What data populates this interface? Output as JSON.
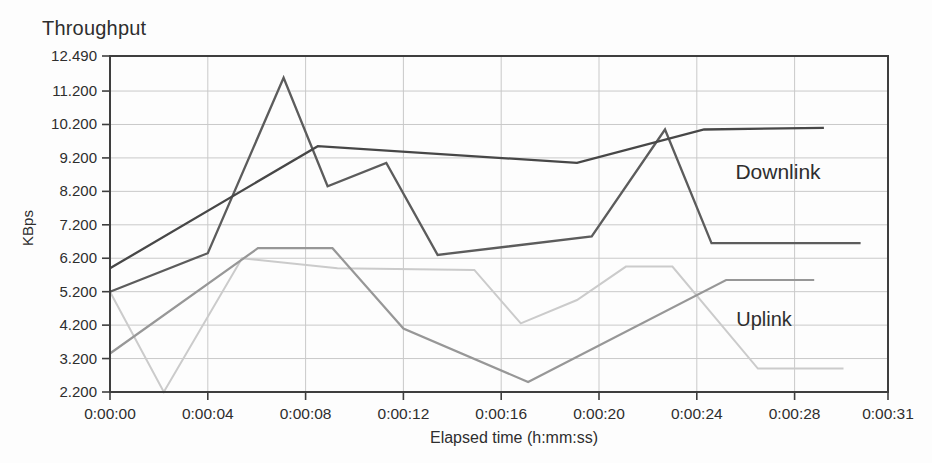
{
  "title": "Throughput",
  "colors": {
    "axis": "#3e3e3e",
    "grid": "#c9c9c9",
    "text": "#2e2e2e",
    "downlink_average": "#474747",
    "downlink_instant": "#5c5c5c",
    "uplink_average": "#979797",
    "uplink_instant": "#cbcbcb"
  },
  "chart_data": {
    "type": "line",
    "title": "Throughput",
    "xlabel": "Elapsed time (h:mm:ss)",
    "ylabel": "KBps",
    "ylim": [
      2.2,
      12.49
    ],
    "xlim_seconds": [
      0,
      31
    ],
    "grid": true,
    "legend_position": "in-plot text annotations",
    "y_ticks": [
      {
        "label": "12.490",
        "value": 12.49
      },
      {
        "label": "11.200",
        "value": 11.2
      },
      {
        "label": "10.200",
        "value": 10.2
      },
      {
        "label": "9.200",
        "value": 9.2
      },
      {
        "label": "8.200",
        "value": 8.2
      },
      {
        "label": "7.200",
        "value": 7.2
      },
      {
        "label": "6.200",
        "value": 6.2
      },
      {
        "label": "5.200",
        "value": 5.2
      },
      {
        "label": "4.200",
        "value": 4.2
      },
      {
        "label": "3.200",
        "value": 3.2
      },
      {
        "label": "2.200",
        "value": 2.2
      }
    ],
    "x_ticks": [
      {
        "label": "0:00:00",
        "t": 0
      },
      {
        "label": "0:00:04",
        "t": 4
      },
      {
        "label": "0:00:08",
        "t": 8
      },
      {
        "label": "0:00:12",
        "t": 12
      },
      {
        "label": "0:00:16",
        "t": 16
      },
      {
        "label": "0:00:20",
        "t": 20
      },
      {
        "label": "0:00:24",
        "t": 24
      },
      {
        "label": "0:00:28",
        "t": 28
      },
      {
        "label": "0:00:31",
        "t": 31
      }
    ],
    "series": [
      {
        "id": "uplink-instantaneous",
        "group": "Uplink",
        "color": "#cbcbcb",
        "width": 2,
        "points": [
          [
            0,
            5.2
          ],
          [
            2.2,
            2.2
          ],
          [
            5.4,
            6.2
          ],
          [
            9.3,
            5.9
          ],
          [
            14.9,
            5.85
          ],
          [
            16.8,
            4.25
          ],
          [
            19.1,
            4.95
          ],
          [
            21.1,
            5.95
          ],
          [
            23.0,
            5.95
          ],
          [
            26.5,
            2.9
          ],
          [
            30.0,
            2.9
          ]
        ]
      },
      {
        "id": "uplink-average",
        "group": "Uplink",
        "color": "#979797",
        "width": 2.2,
        "points": [
          [
            0,
            3.35
          ],
          [
            6.05,
            6.5
          ],
          [
            9.1,
            6.5
          ],
          [
            12.0,
            4.1
          ],
          [
            17.1,
            2.5
          ],
          [
            25.2,
            5.55
          ],
          [
            28.8,
            5.55
          ]
        ]
      },
      {
        "id": "downlink-instantaneous",
        "group": "Downlink",
        "color": "#5c5c5c",
        "width": 2.3,
        "points": [
          [
            0,
            5.2
          ],
          [
            4.0,
            6.35
          ],
          [
            7.1,
            11.6
          ],
          [
            8.9,
            8.35
          ],
          [
            11.3,
            9.05
          ],
          [
            13.4,
            6.3
          ],
          [
            19.7,
            6.85
          ],
          [
            22.7,
            10.05
          ],
          [
            24.6,
            6.65
          ],
          [
            30.7,
            6.65
          ]
        ]
      },
      {
        "id": "downlink-average",
        "group": "Downlink",
        "color": "#474747",
        "width": 2.3,
        "points": [
          [
            0,
            5.9
          ],
          [
            8.5,
            9.55
          ],
          [
            19.1,
            9.05
          ],
          [
            24.3,
            10.05
          ],
          [
            29.2,
            10.1
          ]
        ]
      }
    ],
    "annotations": [
      {
        "text": "Downlink",
        "t": 27.3,
        "v": 8.8
      },
      {
        "text": "Uplink",
        "t": 26.75,
        "v": 4.35
      }
    ]
  }
}
